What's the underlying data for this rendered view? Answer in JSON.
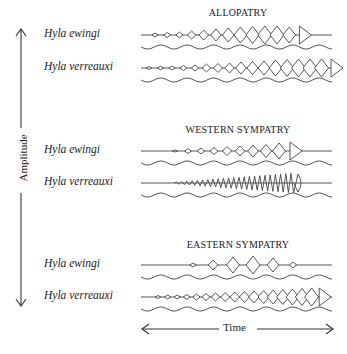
{
  "axes": {
    "y_label": "Amplitude",
    "x_label": "Time"
  },
  "sections": [
    {
      "title": "ALLOPATRY",
      "rows": [
        {
          "species": "Hyla ewingi",
          "pulses": [
            2,
            2.5,
            3,
            4,
            5,
            6,
            7,
            8,
            8.5,
            9,
            9,
            8,
            "end"
          ]
        },
        {
          "species": "Hyla verreauxi",
          "pulses": [
            1.5,
            1.8,
            2,
            2.5,
            3,
            4,
            4.5,
            5,
            6,
            6.5,
            7,
            8,
            8.5,
            9,
            9,
            9,
            "end"
          ]
        }
      ]
    },
    {
      "title": "WESTERN SYMPATRY",
      "rows": [
        {
          "species": "Hyla ewingi",
          "pulses": [
            1,
            2.5,
            3,
            3.5,
            4.5,
            5,
            6,
            6.5,
            8,
            "end"
          ]
        },
        {
          "species": "Hyla verreauxi",
          "pulses": "dense-increasing"
        }
      ]
    },
    {
      "title": "EASTERN SYMPATRY",
      "rows": [
        {
          "species": "Hyla ewingi",
          "pulses": [
            2,
            5,
            8,
            9,
            7,
            3
          ]
        },
        {
          "species": "Hyla verreauxi",
          "pulses": [
            1.5,
            2,
            2,
            2.5,
            3,
            3.5,
            4,
            4.5,
            5,
            5.5,
            6,
            6.5,
            7,
            7.5,
            8,
            8.5,
            9,
            "end"
          ]
        }
      ]
    }
  ]
}
